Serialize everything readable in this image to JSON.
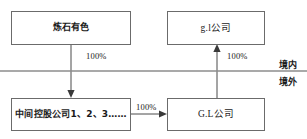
{
  "diagram": {
    "type": "org-structure-flow",
    "boundary": {
      "domestic_label": "境内",
      "offshore_label": "境外",
      "line_color": "#8d8d8d"
    },
    "nodes": [
      {
        "id": "parent-domestic",
        "label": "炼石有色"
      },
      {
        "id": "offshore-top",
        "label": "g.l公司"
      },
      {
        "id": "holding-chain",
        "label": "中间控股公司1、2、3……"
      },
      {
        "id": "offshore-bottom",
        "label": "G.L公司"
      }
    ],
    "edges": [
      {
        "id": "left-ownership",
        "label": "100%",
        "from": "parent-domestic",
        "to": "holding-chain",
        "direction": "down"
      },
      {
        "id": "right-ownership",
        "label": "100%",
        "from": "offshore-bottom",
        "to": "offshore-top",
        "direction": "up"
      },
      {
        "id": "bottom-ownership",
        "label": "100%",
        "from": "holding-chain",
        "to": "offshore-bottom",
        "direction": "right"
      }
    ],
    "colors": {
      "box_border": "#6b6b6b",
      "edge_stroke": "#4a4a4a",
      "background": "#ffffff"
    }
  }
}
